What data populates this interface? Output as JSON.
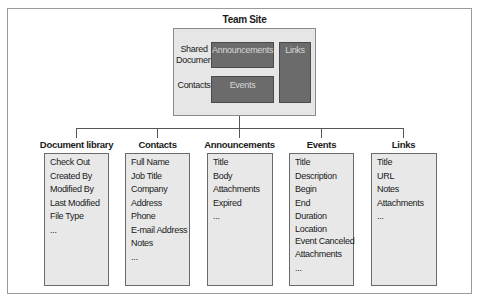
{
  "diagram": {
    "root": {
      "title": "Team Site",
      "labels": [
        "Shared Documents",
        "Contacts"
      ],
      "web_parts": {
        "announcements": "Announcements",
        "events": "Events",
        "links": "Links"
      }
    },
    "lists": [
      {
        "title": "Document library",
        "fields": [
          "Check Out",
          "Created By",
          "Modified By",
          "Last Modified",
          "File Type",
          "..."
        ]
      },
      {
        "title": "Contacts",
        "fields": [
          "Full Name",
          "Job Title",
          "Company",
          "Address",
          "Phone",
          "E-mail Address",
          "Notes",
          "..."
        ]
      },
      {
        "title": "Announcements",
        "fields": [
          "Title",
          "Body",
          "Attachments",
          "Expired",
          "..."
        ]
      },
      {
        "title": "Events",
        "fields": [
          "Title",
          "Description",
          "Begin",
          "End",
          "Duration",
          "Location",
          "Event Canceled",
          "Attachments",
          "..."
        ]
      },
      {
        "title": "Links",
        "fields": [
          "Title",
          "URL",
          "Notes",
          "Attachments",
          "..."
        ]
      }
    ],
    "colors": {
      "site_box": "#e6e6e6",
      "web_part": "#6b6b6b",
      "list_box": "#e8e8e8",
      "lines": "#555555"
    }
  }
}
